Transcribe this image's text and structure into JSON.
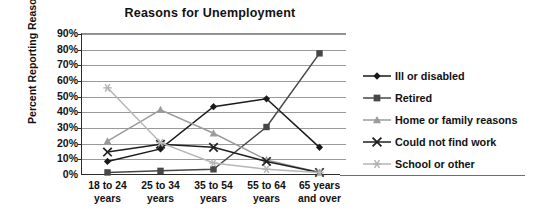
{
  "chart_data": {
    "type": "line",
    "title": "Reasons for Unemployment",
    "xlabel": "",
    "ylabel": "Percent Reporting Reason",
    "categories": [
      "18 to 24 years",
      "25 to 34 years",
      "35 to 54 years",
      "55 to 64 years",
      "65 years and over"
    ],
    "categories_lines": [
      [
        "18 to 24",
        "years"
      ],
      [
        "25 to 34",
        "years"
      ],
      [
        "35 to 54",
        "years"
      ],
      [
        "55 to 64",
        "years"
      ],
      [
        "65 years",
        "and over"
      ]
    ],
    "ylim": [
      0,
      90
    ],
    "ytick_labels": [
      "90%",
      "80%",
      "70%",
      "60%",
      "50%",
      "40%",
      "30%",
      "20%",
      "10%",
      "0%"
    ],
    "ytick_values": [
      90,
      80,
      70,
      60,
      50,
      40,
      30,
      20,
      10,
      0
    ],
    "grid": true,
    "legend_position": "right",
    "series": [
      {
        "name": "Ill or disabled",
        "marker": "diamond",
        "color": "#1a1a1a",
        "values": [
          8,
          16,
          43,
          48,
          17
        ]
      },
      {
        "name": "Retired",
        "marker": "square",
        "color": "#474747",
        "values": [
          1,
          2,
          3,
          30,
          77
        ]
      },
      {
        "name": "Home or family reasons",
        "marker": "triangle",
        "color": "#9b9b9b",
        "values": [
          21,
          41,
          26,
          9,
          1
        ]
      },
      {
        "name": "Could not find work",
        "marker": "x",
        "color": "#1f1f1f",
        "values": [
          14,
          19,
          17,
          8,
          1
        ]
      },
      {
        "name": "School or other",
        "marker": "asterisk",
        "color": "#b6b6b6",
        "values": [
          55,
          20,
          7,
          3,
          1
        ]
      }
    ]
  }
}
